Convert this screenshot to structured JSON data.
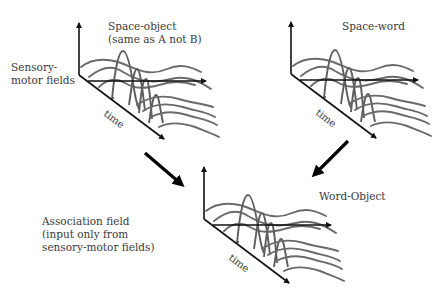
{
  "labels": {
    "sensory_motor_fields": [
      "Sensory-",
      "motor fields"
    ],
    "space_object": [
      "Space-object",
      "(same as A not B)"
    ],
    "space_word": "Space-word",
    "word_object": "Word-Object",
    "association_field": [
      "Association field",
      "(input only from",
      "sensory-motor fields)"
    ],
    "time_axis": "time"
  },
  "fields": [
    {
      "name": "space-object-field",
      "origin": [
        79,
        75
      ]
    },
    {
      "name": "space-word-field",
      "origin": [
        291,
        74
      ]
    },
    {
      "name": "word-object-field",
      "origin": [
        204,
        219
      ]
    }
  ],
  "flows": [
    {
      "name": "flow-arrow-space-object-to-word-object",
      "from": [
        145,
        153
      ],
      "to": [
        182,
        185
      ]
    },
    {
      "name": "flow-arrow-space-word-to-word-object",
      "from": [
        348,
        141
      ],
      "to": [
        314,
        175
      ]
    }
  ],
  "colors": {
    "axis": "#111111",
    "curve": "#6a6a6a",
    "arrow": "#000000",
    "text": "#3a3a3a"
  }
}
